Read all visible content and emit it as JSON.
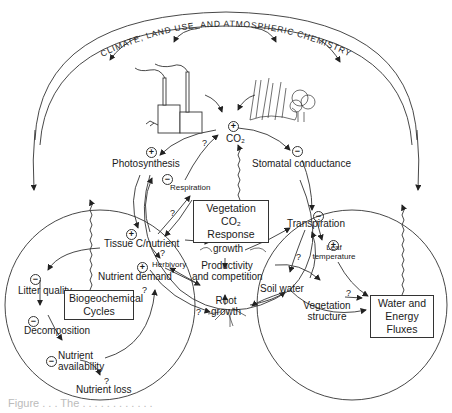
{
  "title_arc": "CLIMATE, LAND USE, AND ATMOSPHERIC CHEMISTRY",
  "nodes": {
    "co2": "CO₂",
    "photosynthesis": "Photosynthesis",
    "respiration": "Respiration",
    "stomatal_conductance": "Stomatal conductance",
    "tissue_cn": "Tissue C/nutrient",
    "herbivory": "Herbivory",
    "nutrient_demand": "Nutrient demand",
    "shoot_growth_1": "Shoot",
    "shoot_growth_2": "growth",
    "productivity_1": "Productivity",
    "productivity_2": "and competition",
    "root_growth_1": "Root",
    "root_growth_2": "growth",
    "transpiration": "Transpiration",
    "leaf_temp_1": "Leaf",
    "leaf_temp_2": "temperature",
    "soil_water": "Soil water",
    "veg_structure_1": "Vegetation",
    "veg_structure_2": "structure",
    "litter_quality": "Litter quality",
    "decomposition": "Decomposition",
    "nutrient_avail_1": "Nutrient",
    "nutrient_avail_2": "availability",
    "nutrient_loss": "Nutrient loss"
  },
  "boxes": {
    "veg_co2_1": "Vegetation",
    "veg_co2_2": "CO₂ Response",
    "biogeo_1": "Biogeochemical",
    "biogeo_2": "Cycles",
    "water_1": "Water and",
    "water_2": "Energy Fluxes"
  },
  "signs": {
    "plus": "+",
    "minus": "−",
    "question": "?"
  },
  "caption": "Figure . . . The . . . . . . . . . . . ."
}
